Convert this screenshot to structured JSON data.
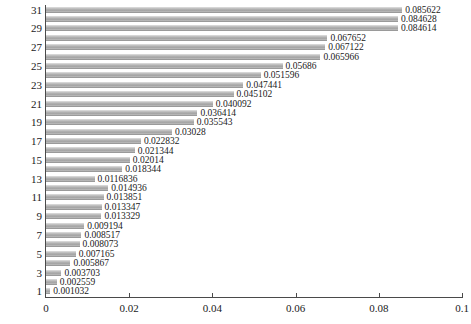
{
  "chart_data": {
    "type": "bar",
    "orientation": "horizontal",
    "title": "",
    "subtitle": "",
    "xlabel": "",
    "ylabel": "",
    "xlim": [
      0,
      0.1
    ],
    "xticks": [
      "0",
      "0.02",
      "0.04",
      "0.06",
      "0.08",
      "0.1"
    ],
    "xtick_values": [
      0,
      0.02,
      0.04,
      0.06,
      0.08,
      0.1
    ],
    "yticks": [
      "1",
      "3",
      "5",
      "7",
      "9",
      "11",
      "13",
      "15",
      "17",
      "19",
      "21",
      "23",
      "25",
      "27",
      "29",
      "31"
    ],
    "ytick_values": [
      1,
      3,
      5,
      7,
      9,
      11,
      13,
      15,
      17,
      19,
      21,
      23,
      25,
      27,
      29,
      31
    ],
    "grid": false,
    "legend": null,
    "bar_color": "#b0b0b0",
    "axis_color": "#4a4a4a",
    "label_color": "#1a1a1a",
    "categories": [
      31,
      30,
      29,
      28,
      27,
      26,
      25,
      24,
      23,
      22,
      21,
      20,
      19,
      18,
      17,
      16,
      15,
      14,
      13,
      12,
      11,
      10,
      9,
      8,
      7,
      6,
      5,
      4,
      3,
      2,
      1
    ],
    "values": [
      0.085622,
      0.084628,
      0.084614,
      0.067652,
      0.067122,
      0.065966,
      0.05686,
      0.051596,
      0.047441,
      0.045102,
      0.040092,
      0.036414,
      0.035543,
      0.03028,
      0.022832,
      0.021344,
      0.02014,
      0.018344,
      0.0116836,
      0.014936,
      0.013851,
      0.013347,
      0.013329,
      0.009194,
      0.008517,
      0.008073,
      0.007165,
      0.005867,
      0.003703,
      0.002559,
      0.001032
    ],
    "data_labels": [
      "0.085622",
      "0.084628",
      "0.084614",
      "0.067652",
      "0.067122",
      "0.065966",
      "0.05686",
      "0.051596",
      "0.047441",
      "0.045102",
      "0.040092",
      "0.036414",
      "0.035543",
      "0.03028",
      "0.022832",
      "0.021344",
      "0.02014",
      "0.018344",
      "0.0116836",
      "0.014936",
      "0.013851",
      "0.013347",
      "0.013329",
      "0.009194",
      "0.008517",
      "0.008073",
      "0.007165",
      "0.005867",
      "0.003703",
      "0.002559",
      "0.001032"
    ]
  }
}
